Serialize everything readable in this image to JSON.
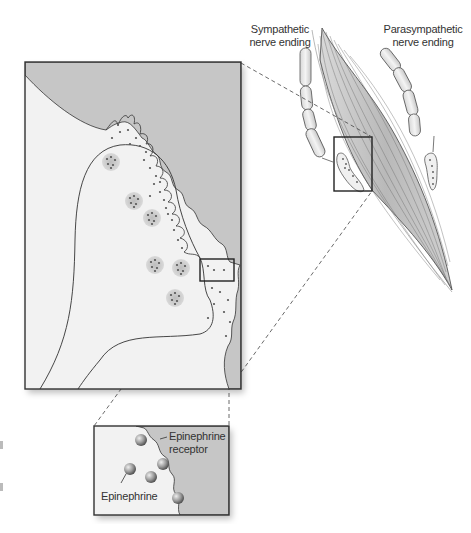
{
  "figure": {
    "labels": {
      "sympathetic": {
        "line1": "Sympathetic",
        "line2": "nerve ending"
      },
      "parasympathetic": {
        "line1": "Parasympathetic",
        "line2": "nerve ending"
      },
      "receptor": {
        "line1": "Epinephrine",
        "line2": "receptor"
      },
      "epinephrine": "Epinephrine"
    },
    "colors": {
      "muscle_gray": "#c4c4c4",
      "cell_light": "#f2f2f2",
      "vesicle_fill": "#cccccc",
      "vesicle_dot": "#555555",
      "outline": "#2a2a2a",
      "sphere": "#9a9a9a"
    }
  }
}
